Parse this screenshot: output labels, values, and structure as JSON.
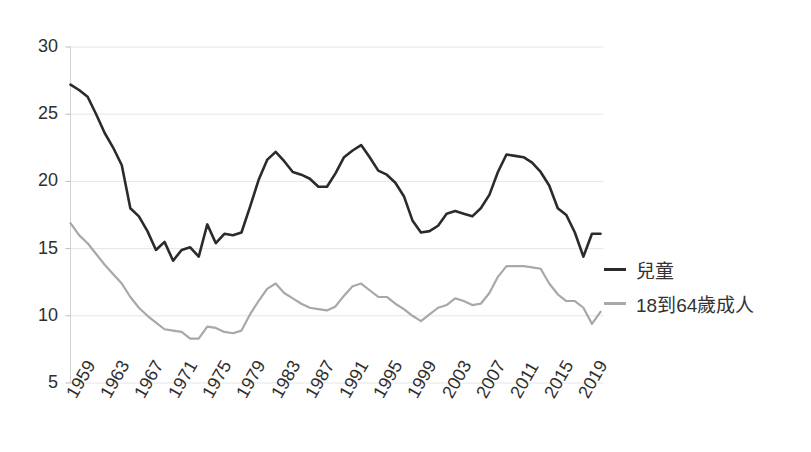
{
  "chart_data": {
    "type": "line",
    "title": "",
    "xlabel": "",
    "ylabel": "",
    "ylim": [
      5,
      30
    ],
    "ytick_values": [
      5,
      10,
      15,
      20,
      25,
      30
    ],
    "ytick_labels": [
      "5",
      "10",
      "15",
      "20",
      "25",
      "30"
    ],
    "grid": true,
    "legend_position": "right",
    "xtick_labels": [
      "1959",
      "1963",
      "1967",
      "1971",
      "1975",
      "1979",
      "1983",
      "1987",
      "1991",
      "1995",
      "1999",
      "2003",
      "2007",
      "2011",
      "2015",
      "2019"
    ],
    "x": [
      1959,
      1960,
      1961,
      1962,
      1963,
      1964,
      1965,
      1966,
      1967,
      1968,
      1969,
      1970,
      1971,
      1972,
      1973,
      1974,
      1975,
      1976,
      1977,
      1978,
      1979,
      1980,
      1981,
      1982,
      1983,
      1984,
      1985,
      1986,
      1987,
      1988,
      1989,
      1990,
      1991,
      1992,
      1993,
      1994,
      1995,
      1996,
      1997,
      1998,
      1999,
      2000,
      2001,
      2002,
      2003,
      2004,
      2005,
      2006,
      2007,
      2008,
      2009,
      2010,
      2011,
      2012,
      2013,
      2014,
      2015,
      2016,
      2017,
      2018,
      2019,
      2020,
      2021
    ],
    "series": [
      {
        "name": "兒童",
        "color": "#2b2b2b",
        "values": [
          27.2,
          26.8,
          26.3,
          25.0,
          23.6,
          22.5,
          21.2,
          18.0,
          17.4,
          16.3,
          14.9,
          15.5,
          14.1,
          14.9,
          15.1,
          14.4,
          16.8,
          15.4,
          16.1,
          16.0,
          16.2,
          18.1,
          20.1,
          21.6,
          22.2,
          21.5,
          20.7,
          20.5,
          20.2,
          19.6,
          19.6,
          20.6,
          21.8,
          22.3,
          22.7,
          21.8,
          20.8,
          20.5,
          19.9,
          18.9,
          17.1,
          16.2,
          16.3,
          16.7,
          17.6,
          17.8,
          17.6,
          17.4,
          18.0,
          19.0,
          20.7,
          22.0,
          21.9,
          21.8,
          21.4,
          20.7,
          19.7,
          18.0,
          17.5,
          16.2,
          14.4,
          16.1,
          16.1
        ]
      },
      {
        "name": "18到64歲成人",
        "color": "#a8a8a8",
        "values": [
          16.9,
          16.0,
          15.4,
          14.6,
          13.8,
          13.1,
          12.4,
          11.4,
          10.6,
          10.0,
          9.5,
          9.0,
          8.9,
          8.8,
          8.3,
          8.3,
          9.2,
          9.1,
          8.8,
          8.7,
          8.9,
          10.1,
          11.1,
          12.0,
          12.4,
          11.7,
          11.3,
          10.9,
          10.6,
          10.5,
          10.4,
          10.7,
          11.5,
          12.2,
          12.4,
          11.9,
          11.4,
          11.4,
          10.9,
          10.5,
          10.0,
          9.6,
          10.1,
          10.6,
          10.8,
          11.3,
          11.1,
          10.8,
          10.9,
          11.7,
          12.9,
          13.7,
          13.7,
          13.7,
          13.6,
          13.5,
          12.4,
          11.6,
          11.1,
          11.1,
          10.6,
          9.4,
          10.3
        ]
      }
    ]
  }
}
